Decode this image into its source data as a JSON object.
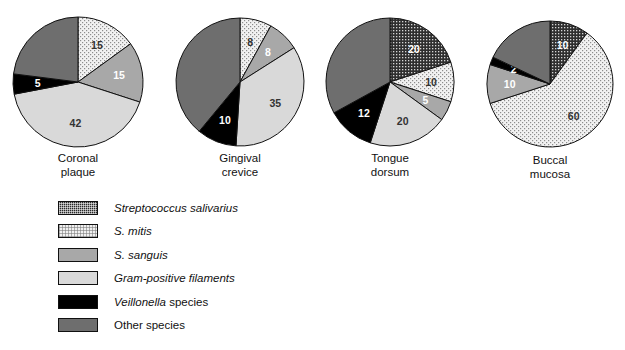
{
  "chart_data": [
    {
      "type": "pie",
      "title": "Coronal plaque",
      "title_lines": [
        "Coronal",
        "plaque"
      ],
      "categories": [
        "Streptococcus salivarius",
        "S. mitis",
        "S. sanguis",
        "Gram-positive filaments",
        "Veillonella species",
        "Other species"
      ],
      "values": [
        0,
        15,
        15,
        42,
        5,
        23
      ],
      "labels": [
        "",
        "15",
        "15",
        "42",
        "5",
        ""
      ],
      "start_angle": 0,
      "legend": "shared"
    },
    {
      "type": "pie",
      "title": "Gingival crevice",
      "title_lines": [
        "Gingival",
        "crevice"
      ],
      "categories": [
        "Streptococcus salivarius",
        "S. mitis",
        "S. sanguis",
        "Gram-positive filaments",
        "Veillonella species",
        "Other species"
      ],
      "values": [
        0,
        8,
        8,
        35,
        10,
        39
      ],
      "labels": [
        "",
        "8",
        "8",
        "35",
        "10",
        ""
      ],
      "start_angle": 0,
      "legend": "shared"
    },
    {
      "type": "pie",
      "title": "Tongue dorsum",
      "title_lines": [
        "Tongue",
        "dorsum"
      ],
      "categories": [
        "Streptococcus salivarius",
        "S. mitis",
        "S. sanguis",
        "Gram-positive filaments",
        "Veillonella species",
        "Other species"
      ],
      "values": [
        20,
        10,
        5,
        20,
        12,
        33
      ],
      "labels": [
        "20",
        "10",
        "5",
        "20",
        "12",
        ""
      ],
      "start_angle": 0,
      "legend": "shared"
    },
    {
      "type": "pie",
      "title": "Buccal mucosa",
      "title_lines": [
        "Buccal",
        "mucosa"
      ],
      "categories": [
        "Streptococcus salivarius",
        "S. mitis",
        "S. sanguis",
        "Gram-positive filaments",
        "Veillonella species",
        "Other species"
      ],
      "values": [
        10,
        60,
        10,
        0,
        2,
        18
      ],
      "labels": [
        "10",
        "60",
        "10",
        "",
        "2",
        ""
      ],
      "start_angle": 0,
      "legend": "shared"
    }
  ],
  "legend": {
    "items": [
      {
        "label": "Streptococcus salivarius",
        "italic_part": "Streptococcus salivarius",
        "roman_part": "",
        "swatch": "f-salivarius",
        "color": "#2b2b2b"
      },
      {
        "label": "S. mitis",
        "italic_part": "S. mitis",
        "roman_part": "",
        "swatch": "f-mitis",
        "color": "#f0f0f0"
      },
      {
        "label": "S. sanguis",
        "italic_part": "S. sanguis",
        "roman_part": "",
        "swatch": "f-sanguis",
        "color": "#a8a8a8"
      },
      {
        "label": "Gram-positive filaments",
        "italic_part": "Gram-positive filaments",
        "roman_part": "",
        "swatch": "f-filaments",
        "color": "#d9d9d9"
      },
      {
        "label": "Veillonella species",
        "italic_part": "Veillonella",
        "roman_part": " species",
        "swatch": "f-veillonella",
        "color": "#000000"
      },
      {
        "label": "Other species",
        "italic_part": "",
        "roman_part": "Other species",
        "swatch": "f-other",
        "color": "#6e6e6e"
      }
    ]
  },
  "pie_layout": [
    {
      "cx": 78,
      "cy": 82,
      "r": 65,
      "caption_x": 8,
      "caption_y": 152
    },
    {
      "cx": 240,
      "cy": 82,
      "r": 64,
      "caption_x": 170,
      "caption_y": 152
    },
    {
      "cx": 390,
      "cy": 82,
      "r": 64,
      "caption_x": 320,
      "caption_y": 152
    },
    {
      "cx": 550,
      "cy": 84,
      "r": 63,
      "caption_x": 480,
      "caption_y": 154
    }
  ]
}
